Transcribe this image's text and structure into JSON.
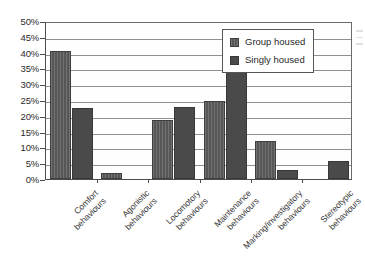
{
  "chart_data": {
    "type": "bar",
    "title": "",
    "xlabel": "",
    "ylabel": "",
    "ylim": [
      0,
      50
    ],
    "ytick_labels": [
      "50%",
      "45%",
      "40%",
      "35%",
      "30%",
      "25%",
      "20%",
      "15%",
      "10%",
      "5%",
      "0%"
    ],
    "ytick_values": [
      50,
      45,
      40,
      35,
      30,
      25,
      20,
      15,
      10,
      5,
      0
    ],
    "grid": true,
    "legend_position": "top-right inset",
    "categories": [
      "Comfort behaviours",
      "Agonistic behaviours",
      "Locomotory behaviours",
      "Maintenance behaviours",
      "Marking/investigatory behaviours",
      "Stereotypic behaviours"
    ],
    "category_lines": [
      [
        "Comfort",
        "behaviours"
      ],
      [
        "Agonistic",
        "behaviours"
      ],
      [
        "Locomotory",
        "behaviours"
      ],
      [
        "Maintenance",
        "behaviours"
      ],
      [
        "Marking/investigatory",
        "behaviours"
      ],
      [
        "Stereotypic",
        "behaviours"
      ]
    ],
    "series": [
      {
        "name": "Group housed",
        "color": "#575757",
        "values": [
          40.5,
          2.0,
          18.7,
          24.7,
          12.0,
          0
        ]
      },
      {
        "name": "Singly housed",
        "color": "#4a4a4a",
        "values": [
          22.5,
          0,
          22.8,
          44.0,
          2.7,
          5.6
        ]
      }
    ]
  },
  "legend": {
    "items": [
      {
        "label": "Group housed"
      },
      {
        "label": "Singly housed"
      }
    ]
  }
}
